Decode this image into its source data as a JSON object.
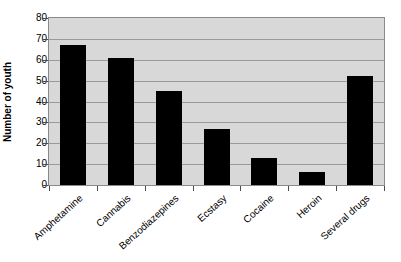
{
  "chart_data": {
    "type": "bar",
    "title": "",
    "subtitle": "",
    "xlabel": "",
    "ylabel": "Number of youth",
    "categories": [
      "Amphetamine",
      "Cannabis",
      "Benzodiazepines",
      "Ecstasy",
      "Cocaine",
      "Heroin",
      "Several drugs"
    ],
    "values": [
      67,
      61,
      45,
      27,
      13,
      6,
      52
    ],
    "ylim": [
      0,
      80
    ],
    "yticks": [
      0,
      10,
      20,
      30,
      40,
      50,
      60,
      70,
      80
    ],
    "ytick_labels": [
      "0",
      "10",
      "20",
      "30",
      "40",
      "50",
      "60",
      "70",
      "80"
    ],
    "grid": "horizontal",
    "legend": "none",
    "bar_color": "#000000",
    "plot_background": "#d8d8d8",
    "gridline_color": "#9a9a9a",
    "figure_background": "#ffffff",
    "xtick_label_rotation": "-42"
  }
}
